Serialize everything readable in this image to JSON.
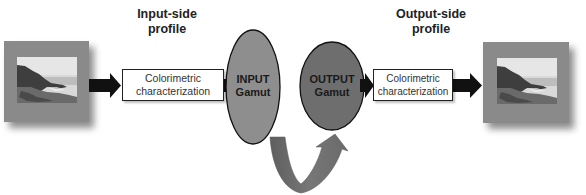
{
  "headings": {
    "input_side": [
      "Input-side",
      "profile"
    ],
    "output_side": [
      "Output-side",
      "profile"
    ]
  },
  "boxes": {
    "input_characterization": [
      "Colorimetric",
      "characterization"
    ],
    "output_characterization": [
      "Colorimetric",
      "characterization"
    ]
  },
  "gamuts": {
    "input": [
      "INPUT",
      "Gamut"
    ],
    "output": [
      "OUTPUT",
      "Gamut"
    ]
  },
  "images": {
    "input": "coastal-landscape-photo",
    "output": "coastal-landscape-photo"
  },
  "colors": {
    "frame": "#8a8a8a",
    "input_gamut": "#8e8e8e",
    "output_gamut": "#6e6e6e",
    "arrow": "#111111",
    "curved_arrow": "#6a6a6a",
    "outline": "#222222"
  }
}
